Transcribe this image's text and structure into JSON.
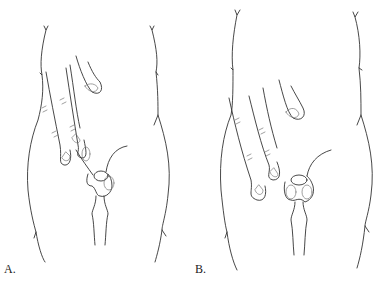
{
  "figure": {
    "panels": [
      {
        "id": "A",
        "label": "A."
      },
      {
        "id": "B",
        "label": "B."
      }
    ],
    "colors": {
      "line": "#333333",
      "background": "#ffffff"
    }
  }
}
